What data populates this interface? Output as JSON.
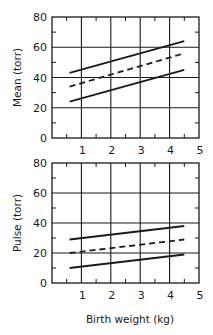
{
  "chart_data": [
    {
      "type": "line",
      "title": "",
      "xlabel": "",
      "ylabel": "Mean (torr)",
      "xlim": [
        0,
        5
      ],
      "ylim": [
        0,
        80
      ],
      "xticks": [
        1,
        2,
        3,
        4,
        5
      ],
      "xtick_labels": [
        "1",
        "2",
        "3",
        "4",
        "5"
      ],
      "yticks": [
        0,
        20,
        40,
        60,
        80
      ],
      "ytick_labels": [
        "0",
        "20",
        "40",
        "60",
        "80"
      ],
      "x_minor_ticks": [
        0.5,
        1.5,
        2.5,
        3.5,
        4.5
      ],
      "y_minor_ticks": [
        10,
        30,
        50,
        70
      ],
      "grid": true,
      "legend": "none",
      "series": [
        {
          "name": "upper",
          "style": "solid",
          "x": [
            0.6,
            4.5
          ],
          "y": [
            43,
            64
          ]
        },
        {
          "name": "mean",
          "style": "dashed",
          "x": [
            0.6,
            4.5
          ],
          "y": [
            34,
            56
          ]
        },
        {
          "name": "lower",
          "style": "solid",
          "x": [
            0.6,
            4.5
          ],
          "y": [
            24,
            45
          ]
        }
      ]
    },
    {
      "type": "line",
      "title": "",
      "xlabel": "Birth weight (kg)",
      "ylabel": "Pulse (torr)",
      "xlim": [
        0,
        5
      ],
      "ylim": [
        0,
        80
      ],
      "xticks": [
        1,
        2,
        3,
        4,
        5
      ],
      "xtick_labels": [
        "1",
        "2",
        "3",
        "4",
        "5"
      ],
      "yticks": [
        0,
        20,
        40,
        60,
        80
      ],
      "ytick_labels": [
        "0",
        "20",
        "40",
        "60",
        "80"
      ],
      "x_minor_ticks": [
        0.5,
        1.5,
        2.5,
        3.5,
        4.5
      ],
      "y_minor_ticks": [
        10,
        30,
        50,
        70
      ],
      "grid": true,
      "legend": "none",
      "series": [
        {
          "name": "upper",
          "style": "solid",
          "x": [
            0.6,
            4.5
          ],
          "y": [
            29,
            38
          ]
        },
        {
          "name": "mean",
          "style": "dashed",
          "x": [
            0.6,
            4.5
          ],
          "y": [
            20,
            29
          ]
        },
        {
          "name": "lower",
          "style": "solid",
          "x": [
            0.6,
            4.5
          ],
          "y": [
            10,
            19
          ]
        }
      ]
    }
  ]
}
